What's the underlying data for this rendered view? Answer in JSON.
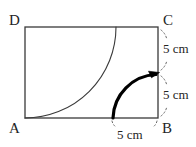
{
  "figure": {
    "background_color": "#ffffff",
    "stroke_color": "#3a3a3a",
    "bold_stroke_color": "#000000",
    "tick_color": "#555555",
    "vertices": [
      {
        "name": "A",
        "label": "A",
        "x": 25,
        "y": 118
      },
      {
        "name": "B",
        "label": "B",
        "x": 158,
        "y": 118
      },
      {
        "name": "C",
        "label": "C",
        "x": 158,
        "y": 27
      },
      {
        "name": "D",
        "label": "D",
        "x": 25,
        "y": 27
      }
    ],
    "rectangle": {
      "left": 25,
      "top": 27,
      "right": 158,
      "bottom": 118,
      "width": 133,
      "height": 91,
      "stroke_width": 1.3
    },
    "arcs": [
      {
        "name": "thin-arc-from-D",
        "style": "thin",
        "center": "D",
        "center_x": 25,
        "center_y": 27,
        "radius": 91,
        "start_point": {
          "x": 116,
          "y": 27
        },
        "end_point": {
          "x": 25,
          "y": 118
        },
        "stroke_width": 1.1,
        "arrowhead": false
      },
      {
        "name": "bold-arc-from-B",
        "style": "bold",
        "center": "B",
        "center_x": 158,
        "center_y": 118,
        "radius": 45,
        "start_point": {
          "x": 113,
          "y": 118
        },
        "end_point": {
          "x": 158,
          "y": 73
        },
        "stroke_width": 3.2,
        "arrowhead": true,
        "arrowhead_direction": "right"
      }
    ],
    "dimensions": [
      {
        "name": "right-upper",
        "value": "5 cm",
        "from": "C",
        "to": "arc-end",
        "side": "right",
        "x": 163,
        "y": 42
      },
      {
        "name": "right-lower",
        "value": "5 cm",
        "from": "arc-end",
        "to": "B",
        "side": "right",
        "x": 163,
        "y": 88
      },
      {
        "name": "bottom-right",
        "value": "5 cm",
        "from": "arc-start",
        "to": "B",
        "side": "bottom",
        "x": 117,
        "y": 128
      }
    ],
    "tick_marks": {
      "description": "short dotted/dashed guide ticks bracketing each 5 cm dimension",
      "color": "#6a6a6a",
      "dash": "1.6 2.4"
    }
  }
}
